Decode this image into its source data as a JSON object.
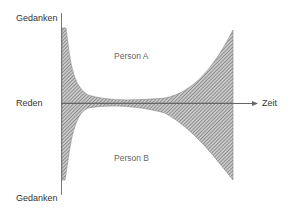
{
  "diagram": {
    "axis_labels": {
      "top": "Gedanken",
      "middle": "Reden",
      "bottom": "Gedanken",
      "time": "Zeit"
    },
    "region_labels": {
      "upper": "Person A",
      "lower": "Person B"
    },
    "colors": {
      "hatch": "#555555",
      "axis": "#666666",
      "text": "#333333"
    }
  }
}
